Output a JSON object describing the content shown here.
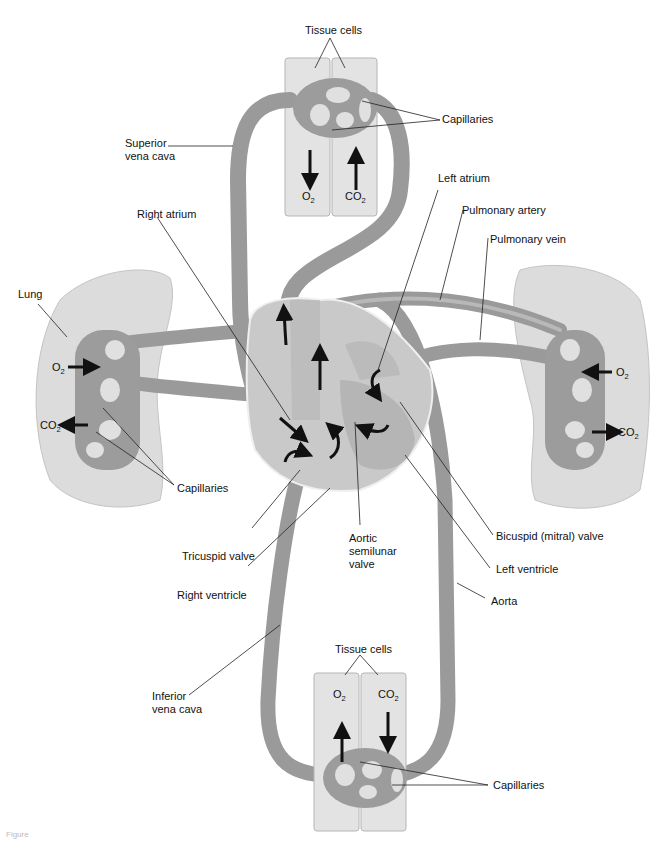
{
  "diagram": {
    "labels": {
      "tissue_cells_top": "Tissue cells",
      "capillaries_top": "Capillaries",
      "superior_vena_cava_1": "Superior",
      "superior_vena_cava_2": "vena cava",
      "right_atrium": "Right atrium",
      "left_atrium": "Left atrium",
      "pulmonary_artery": "Pulmonary artery",
      "pulmonary_vein": "Pulmonary vein",
      "lung": "Lung",
      "capillaries_lung": "Capillaries",
      "tricuspid_valve": "Tricuspid valve",
      "right_ventricle": "Right ventricle",
      "aortic_valve_1": "Aortic",
      "aortic_valve_2": "semilunar",
      "aortic_valve_3": "valve",
      "bicuspid_valve": "Bicuspid (mitral) valve",
      "left_ventricle": "Left ventricle",
      "aorta": "Aorta",
      "inferior_vena_cava_1": "Inferior",
      "inferior_vena_cava_2": "vena cava",
      "tissue_cells_bottom": "Tissue cells",
      "capillaries_bottom": "Capillaries"
    },
    "gases": {
      "o2": "O",
      "co2": "CO",
      "sub": "2"
    },
    "caption": "Figure"
  }
}
